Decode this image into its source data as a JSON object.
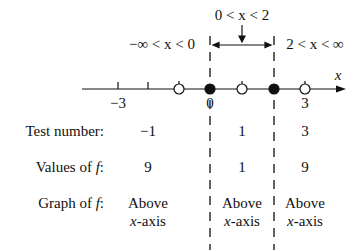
{
  "intervals": {
    "left": "−∞ < x < 0",
    "middle": "0 < x < 2",
    "right": "2 < x < ∞"
  },
  "axis": {
    "variable": "x",
    "tick_labels": [
      {
        "value": "−3",
        "x": 118
      },
      {
        "value": "0",
        "x": 210
      },
      {
        "value": "3",
        "x": 305
      }
    ],
    "ticks": [
      118,
      148,
      179,
      210,
      242,
      274,
      305
    ],
    "open_points": [
      179,
      242,
      305
    ],
    "closed_points": [
      210,
      274
    ]
  },
  "rows": {
    "test_number": {
      "label": "Test number:",
      "values": [
        "−1",
        "1",
        "3"
      ]
    },
    "values_of_f": {
      "label": "Values of f:",
      "values": [
        "9",
        "1",
        "9"
      ]
    },
    "graph_of_f": {
      "label": "Graph of f:",
      "values": [
        [
          "Above",
          "x-axis"
        ],
        [
          "Above",
          "x-axis"
        ],
        [
          "Above",
          "x-axis"
        ]
      ]
    }
  },
  "colors": {
    "ink": "#111111",
    "background": "#ffffff"
  }
}
